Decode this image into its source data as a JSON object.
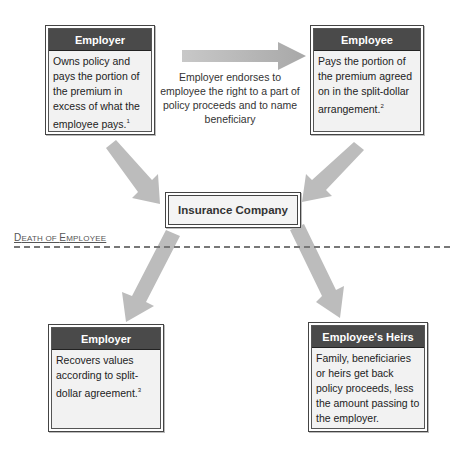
{
  "boxes": {
    "employer_top": {
      "title": "Employer",
      "text": "Owns policy and pays the portion of the premium in excess of what the employee pays.",
      "footnote": "1"
    },
    "employee_top": {
      "title": "Employee",
      "text": "Pays the portion of the premium agreed on in the split-dollar arrangement.",
      "footnote": "2"
    },
    "insurance_company": {
      "title": "Insurance Company"
    },
    "employer_bottom": {
      "title": "Employer",
      "text": "Recovers values according to split-dollar agreement.",
      "footnote": "3"
    },
    "employee_heirs": {
      "title": "Employee's Heirs",
      "text": "Family, beneficiaries or heirs get back policy proceeds, less the amount passing to the employer."
    }
  },
  "arrow_label": "Employer endorses to employee the right to a part of policy proceeds and to name beneficiary",
  "divider": {
    "label_first_cap": "D",
    "label_first_rest": "EATH OF ",
    "label_second_cap": "E",
    "label_second_rest": "MPLOYEE"
  },
  "colors": {
    "header_bg": "#4a4a4a",
    "body_bg": "#f2f2f2",
    "arrow": "#b8b8b8",
    "dash": "#777777"
  }
}
